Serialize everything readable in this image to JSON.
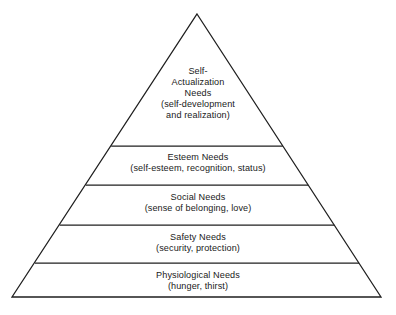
{
  "diagram": {
    "type": "pyramid",
    "name": "Maslow's Hierarchy of Needs",
    "background_color": "#ffffff",
    "ink_color": "#1a1a1a",
    "apex": {
      "x": 197,
      "y": 14
    },
    "base_left": {
      "x": 12,
      "y": 297
    },
    "base_right": {
      "x": 381,
      "y": 297
    },
    "divider_y": [
      146,
      185,
      225,
      263
    ],
    "tiers": [
      {
        "id": "self-actualization",
        "level": 5,
        "title_lines": [
          "Self-",
          "Actualization",
          "Needs"
        ],
        "title": "Self-Actualization Needs",
        "subtitle_lines": [
          "(self-development",
          "and realization)"
        ],
        "subtitle": "(self-development and realization)"
      },
      {
        "id": "esteem",
        "level": 4,
        "title_lines": [
          "Esteem Needs"
        ],
        "title": "Esteem Needs",
        "subtitle_lines": [
          "(self-esteem, recognition, status)"
        ],
        "subtitle": "(self-esteem, recognition, status)"
      },
      {
        "id": "social",
        "level": 3,
        "title_lines": [
          "Social Needs"
        ],
        "title": "Social Needs",
        "subtitle_lines": [
          "(sense of belonging, love)"
        ],
        "subtitle": "(sense of belonging, love)"
      },
      {
        "id": "safety",
        "level": 2,
        "title_lines": [
          "Safety Needs"
        ],
        "title": "Safety Needs",
        "subtitle_lines": [
          "(security, protection)"
        ],
        "subtitle": "(security, protection)"
      },
      {
        "id": "physiological",
        "level": 1,
        "title_lines": [
          "Physiological Needs"
        ],
        "title": "Physiological Needs",
        "subtitle_lines": [
          "(hunger, thirst)"
        ],
        "subtitle": "(hunger, thirst)"
      }
    ]
  },
  "tier_self_actualization": {
    "line1": "Self-",
    "line2": "Actualization",
    "line3": "Needs",
    "line4": "(self-development",
    "line5": "and realization)"
  },
  "tier_esteem": {
    "title": "Esteem Needs",
    "subtitle": "(self-esteem, recognition, status)"
  },
  "tier_social": {
    "title": "Social Needs",
    "subtitle": "(sense of belonging, love)"
  },
  "tier_safety": {
    "title": "Safety Needs",
    "subtitle": "(security, protection)"
  },
  "tier_physiological": {
    "title": "Physiological Needs",
    "subtitle": "(hunger, thirst)"
  }
}
